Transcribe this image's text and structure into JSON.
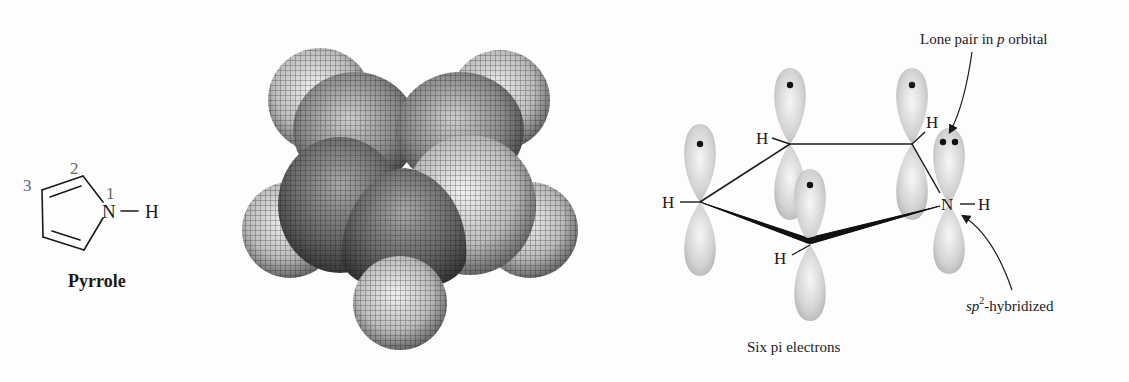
{
  "figure": {
    "panels": [
      {
        "id": "structure",
        "title": "Pyrrole"
      },
      {
        "id": "space-filling-model"
      },
      {
        "id": "orbital-diagram"
      }
    ]
  },
  "structure": {
    "name": "Pyrrole",
    "atom_numbers": {
      "n1": "1",
      "n2": "2",
      "n3": "3"
    },
    "n_label": "N",
    "bond": "—",
    "h_label": "H"
  },
  "orbital": {
    "annotations": {
      "lone_pair": "Lone pair in ",
      "lone_pair_italic": "p",
      "lone_pair_tail": " orbital",
      "hybrid_italic": "sp",
      "hybrid_sup": "2",
      "hybrid_tail": "-hybridized",
      "caption": "Six pi electrons"
    },
    "atoms": {
      "h_left": "H",
      "h_top": "H",
      "h_topright": "H",
      "h_bottom": "H",
      "n": "N",
      "h_n": "H",
      "bond": "—"
    }
  },
  "colors": {
    "ink": "#1a1a1a",
    "lobe": "#c8c8c8",
    "lobe_highlight": "#f4f4f4",
    "sphere_dark": "#4a4a4a",
    "sphere_light": "#e0e0e0",
    "number_gray": "#666666"
  }
}
